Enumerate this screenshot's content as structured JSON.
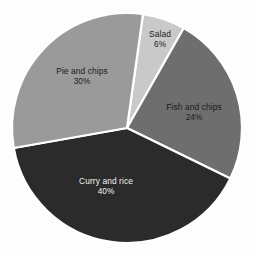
{
  "chart_data": {
    "type": "pie",
    "title": "",
    "subtitle": "",
    "xlabel": "",
    "ylabel": "",
    "legend": "none",
    "grid": false,
    "units": "percent",
    "total": 100,
    "start_angle_deg": 8,
    "direction": "clockwise",
    "categories": [
      "Salad",
      "Fish and chips",
      "Curry and rice",
      "Pie and chips"
    ],
    "values": [
      6,
      24,
      40,
      30
    ],
    "slices": [
      {
        "label": "Salad",
        "value": 6,
        "value_text": "6%",
        "color": "#c9c9c9",
        "text_color": "#1b1b1b",
        "label_x": 160,
        "label_y": 40
      },
      {
        "label": "Fish and chips",
        "value": 24,
        "value_text": "24%",
        "color": "#6e6e6e",
        "text_color": "#1b1b1b",
        "label_x": 194,
        "label_y": 113
      },
      {
        "label": "Curry and rice",
        "value": 40,
        "value_text": "40%",
        "color": "#2b2b2b",
        "text_color": "#f2f2f2",
        "label_x": 106,
        "label_y": 187
      },
      {
        "label": "Pie and chips",
        "value": 30,
        "value_text": "30%",
        "color": "#9a9a9a",
        "text_color": "#1b1b1b",
        "label_x": 82,
        "label_y": 77
      }
    ],
    "geometry": {
      "center_x": 127,
      "center_y": 128,
      "radius": 115,
      "separator_color": "#ffffff",
      "separator_width": 2.2
    },
    "background_color": "#fdfdfd"
  }
}
